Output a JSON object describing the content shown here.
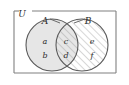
{
  "figure": {
    "type": "venn-diagram",
    "title": "",
    "universe": {
      "label": "U",
      "name": "universal-set",
      "border_color": "#808080",
      "fill_color": "#ffffff",
      "x": 14,
      "y": 11,
      "width": 102,
      "height": 62
    },
    "sets": [
      {
        "id": "A",
        "label": "A",
        "name": "set-a",
        "fill_style": "solid-gray",
        "fill_color": "#e6e6e6",
        "stroke_color": "#5a5a5a",
        "cx": 52,
        "cy": 45,
        "r": 26,
        "label_x": 45,
        "label_y": 21,
        "leader_from_x": 50,
        "leader_from_y": 19,
        "leader_to_x": 60,
        "leader_to_y": 23
      },
      {
        "id": "B",
        "label": "B",
        "name": "set-b",
        "fill_style": "diagonal-hatch",
        "fill_color": "#ffffff",
        "hatch_color": "#9a9a9a",
        "stroke_color": "#5a5a5a",
        "cx": 82,
        "cy": 45,
        "r": 26,
        "label_x": 88,
        "label_y": 21,
        "leader_from_x": 85,
        "leader_from_y": 19,
        "leader_to_x": 74,
        "leader_to_y": 23
      }
    ],
    "regions": [
      {
        "name": "region-a-only",
        "region": "A \\ B",
        "shading": "solid-gray",
        "elements": [
          {
            "label": "a",
            "name": "element-a",
            "x": 45,
            "y": 42
          },
          {
            "label": "b",
            "name": "element-b",
            "x": 45,
            "y": 56
          }
        ]
      },
      {
        "name": "region-intersection",
        "region": "A ∩ B",
        "shading": "solid-gray-with-diagonal-hatch",
        "elements": [
          {
            "label": "c",
            "name": "element-c",
            "x": 66,
            "y": 42
          },
          {
            "label": "d",
            "name": "element-d",
            "x": 66,
            "y": 56
          }
        ]
      },
      {
        "name": "region-b-only",
        "region": "B \\ A",
        "shading": "diagonal-hatch",
        "elements": [
          {
            "label": "e",
            "name": "element-e",
            "x": 92,
            "y": 42
          },
          {
            "label": "f",
            "name": "element-f",
            "x": 92,
            "y": 56
          }
        ]
      }
    ]
  }
}
